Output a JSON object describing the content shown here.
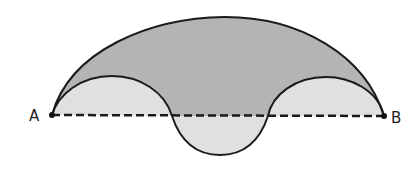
{
  "diagram": {
    "type": "geometry-figure",
    "points": [
      {
        "label": "A",
        "x": 52,
        "y": 115
      },
      {
        "label": "B",
        "x": 384,
        "y": 116
      }
    ],
    "segment": {
      "from": "A",
      "to": "B",
      "style": "dashed"
    },
    "colors": {
      "outer_region": "#b4b4b4",
      "inner_region": "#e0e0e0",
      "stroke": "#1a1a1a",
      "background": "#ffffff"
    }
  }
}
